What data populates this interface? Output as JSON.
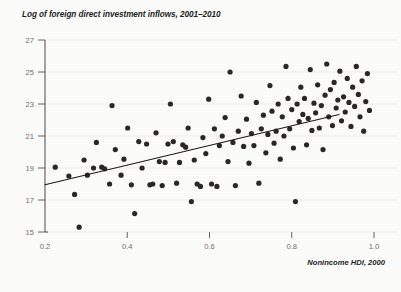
{
  "chart_data": {
    "type": "scatter",
    "title": "Log of foreign direct investment inflows, 2001–2010",
    "xlabel": "Nonincome HDI, 2000",
    "ylabel": "Log of foreign direct investment inflows, 2001–2010",
    "xlim": [
      0.2,
      1.0
    ],
    "ylim": [
      15,
      27
    ],
    "xticks": [
      "0.2",
      "0.4",
      "0.6",
      "0.8",
      "1.0"
    ],
    "xtick_values": [
      0.2,
      0.4,
      0.6,
      0.8,
      1.0
    ],
    "yticks": [
      "15",
      "17",
      "19",
      "21",
      "23",
      "25",
      "27"
    ],
    "ytick_values": [
      15,
      17,
      19,
      21,
      23,
      25,
      27
    ],
    "grid": "horizontal",
    "legend": "none",
    "marker_color": "#2b2725",
    "line_color": "#1d1a19",
    "trendline": {
      "x": [
        0.2,
        0.915
      ],
      "y": [
        17.95,
        22.35
      ]
    },
    "points": [
      {
        "x": 0.225,
        "y": 19.05
      },
      {
        "x": 0.258,
        "y": 18.5
      },
      {
        "x": 0.272,
        "y": 17.35
      },
      {
        "x": 0.283,
        "y": 15.3
      },
      {
        "x": 0.295,
        "y": 19.5
      },
      {
        "x": 0.303,
        "y": 18.55
      },
      {
        "x": 0.318,
        "y": 19.0
      },
      {
        "x": 0.325,
        "y": 20.6
      },
      {
        "x": 0.338,
        "y": 19.05
      },
      {
        "x": 0.345,
        "y": 18.95
      },
      {
        "x": 0.357,
        "y": 18.0
      },
      {
        "x": 0.363,
        "y": 22.9
      },
      {
        "x": 0.371,
        "y": 20.15
      },
      {
        "x": 0.385,
        "y": 18.55
      },
      {
        "x": 0.392,
        "y": 19.55
      },
      {
        "x": 0.401,
        "y": 21.5
      },
      {
        "x": 0.41,
        "y": 17.95
      },
      {
        "x": 0.418,
        "y": 16.15
      },
      {
        "x": 0.428,
        "y": 20.65
      },
      {
        "x": 0.436,
        "y": 19.0
      },
      {
        "x": 0.447,
        "y": 20.5
      },
      {
        "x": 0.455,
        "y": 17.95
      },
      {
        "x": 0.462,
        "y": 18.0
      },
      {
        "x": 0.47,
        "y": 21.2
      },
      {
        "x": 0.478,
        "y": 19.4
      },
      {
        "x": 0.485,
        "y": 17.9
      },
      {
        "x": 0.492,
        "y": 19.35
      },
      {
        "x": 0.499,
        "y": 20.5
      },
      {
        "x": 0.505,
        "y": 23.0
      },
      {
        "x": 0.512,
        "y": 20.65
      },
      {
        "x": 0.52,
        "y": 18.05
      },
      {
        "x": 0.527,
        "y": 19.35
      },
      {
        "x": 0.535,
        "y": 20.45
      },
      {
        "x": 0.542,
        "y": 20.3
      },
      {
        "x": 0.548,
        "y": 21.5
      },
      {
        "x": 0.556,
        "y": 16.9
      },
      {
        "x": 0.563,
        "y": 19.5
      },
      {
        "x": 0.57,
        "y": 18.0
      },
      {
        "x": 0.578,
        "y": 17.85
      },
      {
        "x": 0.584,
        "y": 20.9
      },
      {
        "x": 0.591,
        "y": 19.9
      },
      {
        "x": 0.598,
        "y": 23.3
      },
      {
        "x": 0.605,
        "y": 18.0
      },
      {
        "x": 0.612,
        "y": 21.45
      },
      {
        "x": 0.618,
        "y": 17.85
      },
      {
        "x": 0.624,
        "y": 20.4
      },
      {
        "x": 0.631,
        "y": 21.0
      },
      {
        "x": 0.638,
        "y": 22.15
      },
      {
        "x": 0.645,
        "y": 19.4
      },
      {
        "x": 0.65,
        "y": 25.0
      },
      {
        "x": 0.657,
        "y": 20.6
      },
      {
        "x": 0.663,
        "y": 17.9
      },
      {
        "x": 0.67,
        "y": 21.3
      },
      {
        "x": 0.677,
        "y": 23.5
      },
      {
        "x": 0.683,
        "y": 20.35
      },
      {
        "x": 0.69,
        "y": 22.05
      },
      {
        "x": 0.696,
        "y": 19.3
      },
      {
        "x": 0.702,
        "y": 21.15
      },
      {
        "x": 0.708,
        "y": 20.4
      },
      {
        "x": 0.714,
        "y": 23.1
      },
      {
        "x": 0.72,
        "y": 18.05
      },
      {
        "x": 0.726,
        "y": 21.45
      },
      {
        "x": 0.731,
        "y": 22.3
      },
      {
        "x": 0.737,
        "y": 19.95
      },
      {
        "x": 0.742,
        "y": 21.1
      },
      {
        "x": 0.747,
        "y": 24.15
      },
      {
        "x": 0.752,
        "y": 22.55
      },
      {
        "x": 0.757,
        "y": 20.55
      },
      {
        "x": 0.762,
        "y": 21.3
      },
      {
        "x": 0.767,
        "y": 23.0
      },
      {
        "x": 0.772,
        "y": 19.55
      },
      {
        "x": 0.777,
        "y": 22.2
      },
      {
        "x": 0.781,
        "y": 21.0
      },
      {
        "x": 0.786,
        "y": 25.35
      },
      {
        "x": 0.791,
        "y": 23.35
      },
      {
        "x": 0.795,
        "y": 21.45
      },
      {
        "x": 0.8,
        "y": 22.65
      },
      {
        "x": 0.804,
        "y": 20.25
      },
      {
        "x": 0.809,
        "y": 16.9
      },
      {
        "x": 0.813,
        "y": 23.0
      },
      {
        "x": 0.818,
        "y": 21.9
      },
      {
        "x": 0.822,
        "y": 24.05
      },
      {
        "x": 0.827,
        "y": 22.35
      },
      {
        "x": 0.831,
        "y": 23.35
      },
      {
        "x": 0.836,
        "y": 20.45
      },
      {
        "x": 0.84,
        "y": 22.1
      },
      {
        "x": 0.845,
        "y": 25.15
      },
      {
        "x": 0.849,
        "y": 21.35
      },
      {
        "x": 0.854,
        "y": 23.05
      },
      {
        "x": 0.858,
        "y": 22.45
      },
      {
        "x": 0.863,
        "y": 24.2
      },
      {
        "x": 0.867,
        "y": 21.5
      },
      {
        "x": 0.872,
        "y": 22.9
      },
      {
        "x": 0.876,
        "y": 20.15
      },
      {
        "x": 0.881,
        "y": 23.55
      },
      {
        "x": 0.885,
        "y": 25.5
      },
      {
        "x": 0.89,
        "y": 22.2
      },
      {
        "x": 0.894,
        "y": 23.9
      },
      {
        "x": 0.899,
        "y": 21.65
      },
      {
        "x": 0.903,
        "y": 24.35
      },
      {
        "x": 0.908,
        "y": 22.75
      },
      {
        "x": 0.912,
        "y": 23.25
      },
      {
        "x": 0.917,
        "y": 25.05
      },
      {
        "x": 0.921,
        "y": 21.95
      },
      {
        "x": 0.926,
        "y": 23.45
      },
      {
        "x": 0.93,
        "y": 22.5
      },
      {
        "x": 0.935,
        "y": 24.6
      },
      {
        "x": 0.939,
        "y": 23.1
      },
      {
        "x": 0.944,
        "y": 21.6
      },
      {
        "x": 0.948,
        "y": 24.05
      },
      {
        "x": 0.953,
        "y": 22.85
      },
      {
        "x": 0.957,
        "y": 25.35
      },
      {
        "x": 0.962,
        "y": 23.6
      },
      {
        "x": 0.966,
        "y": 22.2
      },
      {
        "x": 0.971,
        "y": 24.45
      },
      {
        "x": 0.975,
        "y": 21.3
      },
      {
        "x": 0.98,
        "y": 23.15
      },
      {
        "x": 0.984,
        "y": 24.9
      },
      {
        "x": 0.989,
        "y": 22.6
      }
    ]
  }
}
